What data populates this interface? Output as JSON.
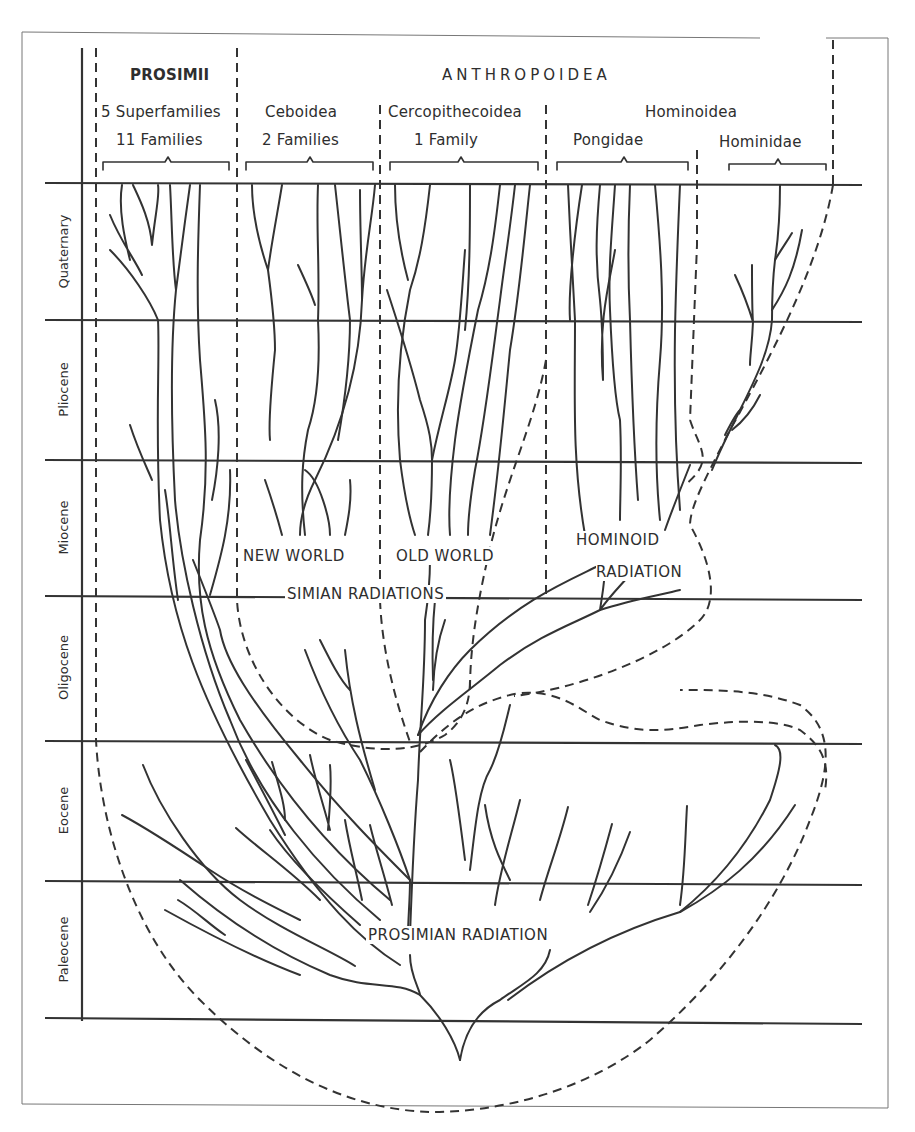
{
  "diagram": {
    "type": "phylogenetic-tree",
    "header": {
      "prosimii": {
        "title": "PROSIMII",
        "line1": "5 Superfamilies",
        "line2": "11 Families"
      },
      "anthropoidea": {
        "title": "ANTHROPOIDEA",
        "ceboidea": {
          "name": "Ceboidea",
          "count": "2 Families"
        },
        "cercopithecoidea": {
          "name": "Cercopithecoidea",
          "count": "1 Family"
        },
        "hominoidea": {
          "name": "Hominoidea",
          "pongidae": "Pongidae",
          "hominidae": "Hominidae"
        }
      }
    },
    "epochs": [
      {
        "name": "Quaternary"
      },
      {
        "name": "Pliocene"
      },
      {
        "name": "Miocene"
      },
      {
        "name": "Oligocene"
      },
      {
        "name": "Eocene"
      },
      {
        "name": "Paleocene"
      }
    ],
    "annotations": {
      "new_world": "NEW WORLD",
      "old_world": "OLD WORLD",
      "simian_radiations": "SIMIAN RADIATIONS",
      "hominoid_line1": "HOMINOID",
      "hominoid_line2": "RADIATION",
      "prosimian_radiation": "PROSIMIAN RADIATION"
    },
    "colors": {
      "ink": "#333333",
      "paper": "#ffffff",
      "frame": "#777777"
    }
  }
}
